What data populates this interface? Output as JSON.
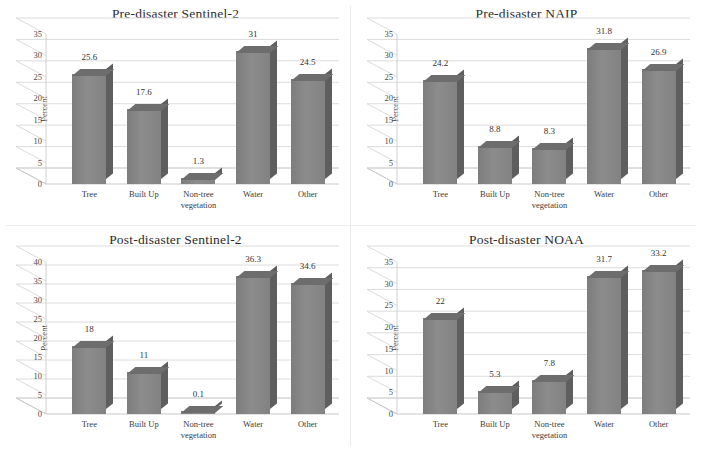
{
  "figure": {
    "axis_title": "Percent",
    "categories": [
      "Tree",
      "Built Up",
      "Non-tree vegetation",
      "Water",
      "Other"
    ],
    "bar_color": "#808080",
    "bar_side_color": "#5e5e5e",
    "bar_top_color": "#6d6d6d"
  },
  "chart_data": [
    {
      "type": "bar",
      "title": "Pre-disaster Sentinel-2",
      "xlabel": "",
      "ylabel": "Percent",
      "categories": [
        "Tree",
        "Built Up",
        "Non-tree vegetation",
        "Water",
        "Other"
      ],
      "values": [
        25.6,
        17.6,
        1.3,
        31,
        24.5
      ],
      "labels": [
        "25.6",
        "17.6",
        "1.3",
        "31",
        "24.5"
      ],
      "ylim": [
        0,
        35
      ],
      "yticks": [
        0,
        5,
        10,
        15,
        20,
        25,
        30,
        35
      ],
      "grid": true,
      "legend": "none"
    },
    {
      "type": "bar",
      "title": "Pre-disaster NAIP",
      "xlabel": "",
      "ylabel": "Percent",
      "categories": [
        "Tree",
        "Built Up",
        "Non-tree vegetation",
        "Water",
        "Other"
      ],
      "values": [
        24.2,
        8.8,
        8.3,
        31.8,
        26.9
      ],
      "labels": [
        "24.2",
        "8.8",
        "8.3",
        "31.8",
        "26.9"
      ],
      "ylim": [
        0,
        35
      ],
      "yticks": [
        0,
        5,
        10,
        15,
        20,
        25,
        30,
        35
      ],
      "grid": true,
      "legend": "none"
    },
    {
      "type": "bar",
      "title": "Post-disaster Sentinel-2",
      "xlabel": "",
      "ylabel": "Percent",
      "categories": [
        "Tree",
        "Built Up",
        "Non-tree vegetation",
        "Water",
        "Other"
      ],
      "values": [
        18,
        11,
        0.1,
        36.3,
        34.6
      ],
      "labels": [
        "18",
        "11",
        "0.1",
        "36.3",
        "34.6"
      ],
      "ylim": [
        0,
        40
      ],
      "yticks": [
        0,
        5,
        10,
        15,
        20,
        25,
        30,
        35,
        40
      ],
      "grid": true,
      "legend": "none"
    },
    {
      "type": "bar",
      "title": "Post-disaster NOAA",
      "xlabel": "",
      "ylabel": "Percent",
      "categories": [
        "Tree",
        "Built Up",
        "Non-tree vegetation",
        "Water",
        "Other"
      ],
      "values": [
        22,
        5.3,
        7.8,
        31.7,
        33.2
      ],
      "labels": [
        "22",
        "5.3",
        "7.8",
        "31.7",
        "33.2"
      ],
      "ylim": [
        0,
        35
      ],
      "yticks": [
        0,
        5,
        10,
        15,
        20,
        25,
        30,
        35
      ],
      "grid": true,
      "legend": "none"
    }
  ]
}
